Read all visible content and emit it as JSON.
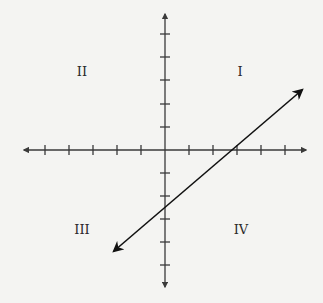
{
  "diagram": {
    "type": "coordinate-plane",
    "quadrant_labels": {
      "q1": "I",
      "q2": "II",
      "q3": "III",
      "q4": "IV"
    },
    "x_axis": {
      "ticks_negative": 5,
      "ticks_positive": 5,
      "arrows": "both"
    },
    "y_axis": {
      "ticks_negative": 5,
      "ticks_positive": 5,
      "arrows": "both"
    },
    "line": {
      "arrows": "both",
      "x_intercept": 3,
      "y_intercept": -2.5,
      "slope": 0.83,
      "passes_through_quadrants": [
        "I",
        "III",
        "IV"
      ]
    },
    "colors": {
      "background": "#f4f4f2",
      "axis": "#3a3a3a",
      "line": "#111111",
      "label": "#2a2a2a"
    }
  }
}
